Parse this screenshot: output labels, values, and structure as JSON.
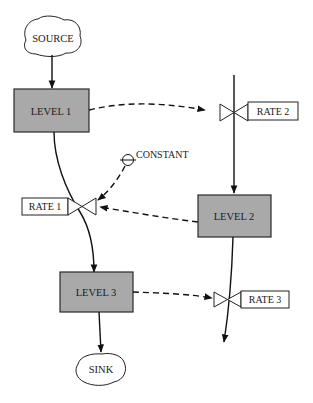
{
  "diagram": {
    "type": "stock-and-flow",
    "nodes": {
      "source": {
        "label": "SOURCE",
        "kind": "cloud"
      },
      "sink": {
        "label": "SINK",
        "kind": "cloud"
      },
      "level1": {
        "label": "LEVEL 1",
        "kind": "level"
      },
      "level2": {
        "label": "LEVEL 2",
        "kind": "level"
      },
      "level3": {
        "label": "LEVEL 3",
        "kind": "level"
      },
      "rate1": {
        "label": "RATE 1",
        "kind": "rate"
      },
      "rate2": {
        "label": "RATE 2",
        "kind": "rate"
      },
      "rate3": {
        "label": "RATE 3",
        "kind": "rate"
      },
      "constant": {
        "label": "CONSTANT",
        "kind": "constant"
      }
    },
    "material_flows": [
      {
        "from": "source",
        "to": "level1"
      },
      {
        "from": "level1",
        "to": "level3",
        "via": "rate1"
      },
      {
        "from": "level3",
        "to": "sink"
      },
      {
        "from": "top",
        "to": "level2",
        "via": "rate2"
      },
      {
        "from": "level2",
        "to": "bottom",
        "via": "rate3"
      }
    ],
    "information_links": [
      {
        "from": "level1",
        "to": "rate2"
      },
      {
        "from": "constant",
        "to": "rate1"
      },
      {
        "from": "level2",
        "to": "rate1"
      },
      {
        "from": "level3",
        "to": "rate3"
      }
    ],
    "colors": {
      "level_fill": "#a9a9a9",
      "stroke": "#111111",
      "background": "#ffffff"
    }
  }
}
